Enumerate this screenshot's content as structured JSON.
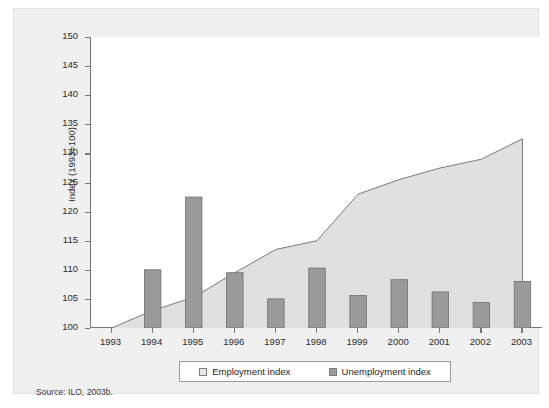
{
  "figure": {
    "caption_partial": "",
    "source_note": "Source: ILO, 2003b.",
    "ylabel": "Index (1993=100)"
  },
  "legend": {
    "position": "bottom-center",
    "entries": [
      {
        "label": "Employment index",
        "swatch": "employment-swatch",
        "color": "#e0e0e0"
      },
      {
        "label": "Unemployment index",
        "swatch": "unemployment-swatch",
        "color": "#9a9a9a"
      }
    ]
  },
  "colors": {
    "area_fill": "#e0e0e0",
    "area_line": "#7a7a7a",
    "bar_fill": "#9a9a9a",
    "bar_edge": "#6f6f6f",
    "panel_bg": "#ffffff",
    "card_bg": "#f0f0f0",
    "axis": "#777777",
    "text": "#2b2b2b"
  },
  "chart_data": {
    "type": "area",
    "title": "",
    "subtitle": "",
    "xlabel": "",
    "ylabel": "Index (1993=100)",
    "categories": [
      "1993",
      "1994",
      "1995",
      "1996",
      "1997",
      "1998",
      "1999",
      "2000",
      "2001",
      "2002",
      "2003"
    ],
    "x": [
      1993,
      1994,
      1995,
      1996,
      1997,
      1998,
      1999,
      2000,
      2001,
      2002,
      2003
    ],
    "ylim": [
      100,
      150
    ],
    "yticks": [
      100,
      105,
      110,
      115,
      120,
      125,
      130,
      135,
      140,
      145,
      150
    ],
    "ytick_labels": [
      "100",
      "105",
      "110",
      "115",
      "120",
      "125",
      "130",
      "135",
      "140",
      "145",
      "150"
    ],
    "grid": false,
    "legend": [
      "Employment index",
      "Unemployment index"
    ],
    "series": [
      {
        "name": "Employment index",
        "type": "area",
        "color": "#e0e0e0",
        "values": [
          100,
          103,
          105.3,
          109.5,
          113.5,
          115,
          123,
          125.5,
          127.5,
          129,
          132.5
        ]
      },
      {
        "name": "Unemployment index",
        "type": "bar",
        "color": "#9a9a9a",
        "values": [
          null,
          110,
          122.5,
          109.5,
          105,
          110.3,
          105.6,
          108.3,
          106.2,
          104.4,
          108
        ]
      }
    ]
  }
}
